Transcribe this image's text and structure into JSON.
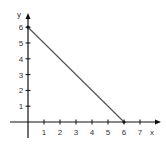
{
  "chart_data": {
    "type": "line",
    "title": "",
    "xlabel": "x",
    "ylabel": "y",
    "xlim": [
      0,
      7
    ],
    "ylim": [
      0,
      6
    ],
    "x_ticks": [
      1,
      2,
      3,
      4,
      5,
      6,
      7
    ],
    "y_ticks": [
      1,
      2,
      3,
      4,
      5,
      6
    ],
    "grid": false,
    "legend": null,
    "series": [
      {
        "name": "line",
        "x": [
          0,
          6
        ],
        "y": [
          6,
          0
        ],
        "color": "#555555"
      }
    ]
  },
  "colors": {
    "axis": "#111111",
    "line": "#555555",
    "text": "#333333"
  }
}
